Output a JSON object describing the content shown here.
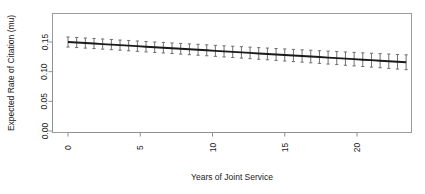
{
  "chart_data": {
    "type": "line",
    "title": "",
    "subtitle": "",
    "xlabel": "Years of Joint Service",
    "ylabel": "Expected Rate of Citation (mu)",
    "xlim": [
      -0.6,
      23.8
    ],
    "ylim": [
      0.0,
      0.163
    ],
    "xticks": [
      0,
      5,
      10,
      15,
      20
    ],
    "xticklabels": [
      "0",
      "5",
      "10",
      "15",
      "20"
    ],
    "yticks": [
      0.0,
      0.05,
      0.1,
      0.15
    ],
    "yticklabels": [
      "0.00",
      "0.05",
      "0.10",
      "0.15"
    ],
    "grid": false,
    "legend": null,
    "legend_position": "none",
    "series": [
      {
        "name": "Expected rate of citation",
        "style": "line-with-error-bars",
        "color": "#1a1a1a",
        "errorbar_color": "#6e6e6e",
        "x": [
          0.0,
          0.6,
          1.2,
          1.8,
          2.4,
          3.0,
          3.6,
          4.2,
          4.8,
          5.4,
          6.0,
          6.6,
          7.2,
          7.8,
          8.4,
          9.0,
          9.6,
          10.2,
          10.8,
          11.4,
          12.0,
          12.6,
          13.2,
          13.8,
          14.4,
          15.0,
          15.6,
          16.2,
          16.8,
          17.4,
          18.0,
          18.6,
          19.2,
          19.8,
          20.4,
          21.0,
          21.6,
          22.2,
          22.8,
          23.4
        ],
        "y": [
          0.15,
          0.1491,
          0.1482,
          0.1474,
          0.1465,
          0.1456,
          0.1447,
          0.1439,
          0.143,
          0.1421,
          0.1412,
          0.1404,
          0.1395,
          0.1386,
          0.1377,
          0.1369,
          0.136,
          0.1351,
          0.1342,
          0.1334,
          0.1325,
          0.1316,
          0.1307,
          0.1299,
          0.129,
          0.1281,
          0.1272,
          0.1264,
          0.1255,
          0.1246,
          0.1237,
          0.1229,
          0.122,
          0.1211,
          0.1202,
          0.1194,
          0.1185,
          0.1176,
          0.1167,
          0.1159
        ],
        "yerr": [
          0.0085,
          0.0085,
          0.0085,
          0.0085,
          0.0086,
          0.0086,
          0.0086,
          0.0087,
          0.0087,
          0.0088,
          0.0088,
          0.0089,
          0.0089,
          0.009,
          0.0091,
          0.0092,
          0.0092,
          0.0093,
          0.0094,
          0.0095,
          0.0096,
          0.0097,
          0.0098,
          0.0099,
          0.01,
          0.0102,
          0.0103,
          0.0104,
          0.0106,
          0.0107,
          0.0109,
          0.011,
          0.0112,
          0.0114,
          0.0115,
          0.0117,
          0.0119,
          0.0121,
          0.0123,
          0.0125
        ]
      }
    ]
  }
}
